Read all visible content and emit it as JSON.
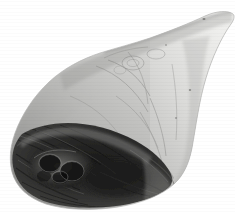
{
  "page": {
    "width": 235,
    "height": 213,
    "background_color": "#ffffff",
    "kind": "scanned-book-page-fragment"
  },
  "caption": {
    "text": "stew and ragout.",
    "color": "#4a4a4a",
    "style": "serif"
  },
  "photo": {
    "subject": "whole ham / gammon leg joint",
    "description": "Black and white photograph of a whole uncooked ham (leg of pork) laid on a plain white background. The broad butt end is at the lower left and shows a dark, coarsely textured cut surface with exposed bone and muscle. The joint tapers toward the upper right into a slender shank end.",
    "color_mode": "grayscale",
    "colors": {
      "background": "#ffffff",
      "skin_highlight": "#e4e4e2",
      "skin_light": "#d2d2d0",
      "skin_mid": "#b6b6b4",
      "skin_shadow": "#9a9a98",
      "rind_edge": "#7f7f7d",
      "fat_rim": "#cfcfcd",
      "cut_surface_mid": "#5a5a58",
      "cut_surface_dark": "#2e2e2d",
      "cut_surface_deepest": "#161616"
    },
    "regions": [
      {
        "name": "shank-end",
        "position": "upper-right",
        "tone": "light"
      },
      {
        "name": "ham-body",
        "position": "centre",
        "tone": "mid-light"
      },
      {
        "name": "rind-surface",
        "position": "upper-left-slope",
        "tone": "mid"
      },
      {
        "name": "fat-rim",
        "position": "lower-left-edge",
        "tone": "light"
      },
      {
        "name": "cut-surface",
        "position": "lower-left",
        "tone": "dark"
      },
      {
        "name": "bone-and-marrow",
        "position": "lower-left-centre",
        "tone": "darkest"
      }
    ]
  }
}
